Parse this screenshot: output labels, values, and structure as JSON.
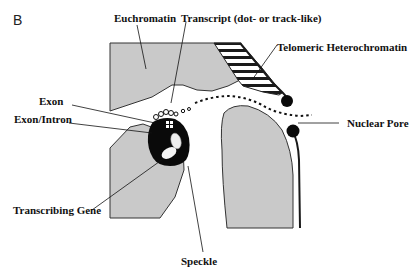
{
  "figure": {
    "panel_label": "B",
    "labels": {
      "euchromatin": "Euchromatin",
      "transcript": "Transcript (dot- or track-like)",
      "telomeric": "Telomeric Heterochromatin",
      "exon": "Exon",
      "exon_intron": "Exon/Intron",
      "nuclear_pore": "Nuclear Pore",
      "transcribing_gene": "Transcribing Gene",
      "speckle": "Speckle"
    },
    "colors": {
      "chromatin_fill": "#c9c9c9",
      "outline": "#2a2a2a",
      "speckle": "#0a0a0a",
      "background": "#ffffff"
    }
  }
}
